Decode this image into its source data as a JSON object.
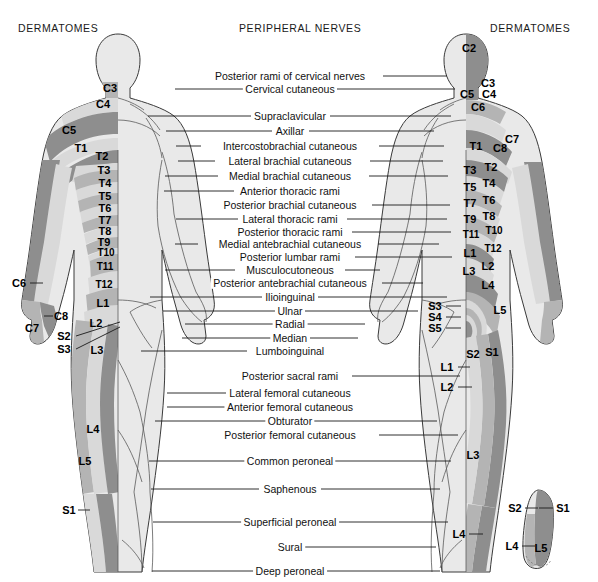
{
  "headers": {
    "left": "DERMATOMES",
    "middle": "PERIPHERAL NERVES",
    "right": "DERMATOMES"
  },
  "colors": {
    "background": "#ffffff",
    "body_fill": "#e9e9e9",
    "outline": "#3a3a3a",
    "band_light": "#d9d9d9",
    "band_mid": "#b4b4b4",
    "band_dark": "#8e8e8e",
    "band_darker": "#6f6f6f",
    "text": "#111111",
    "leader_line": "#1a1a1a"
  },
  "peripheral_nerves": [
    {
      "label": "Posterior rami of cervical nerves",
      "cx": 290,
      "cy": 76,
      "left_line": null,
      "right_line": [
        383,
        76,
        447,
        76
      ]
    },
    {
      "label": "Cervical cutaneous",
      "cx": 290,
      "cy": 89,
      "left_line": [
        175,
        89,
        244,
        89
      ],
      "right_line": [
        337,
        89,
        455,
        89
      ]
    },
    {
      "label": "Supraclavicular",
      "cx": 290,
      "cy": 116,
      "left_line": [
        148,
        116,
        251,
        116
      ],
      "right_line": [
        330,
        116,
        451,
        116
      ]
    },
    {
      "label": "Axillar",
      "cx": 290,
      "cy": 131,
      "left_line": [
        166,
        131,
        272,
        131
      ],
      "right_line": [
        309,
        131,
        434,
        131
      ]
    },
    {
      "label": "Intercostobrachial cutaneous",
      "cx": 290,
      "cy": 146,
      "left_line": [
        176,
        146,
        201,
        146
      ],
      "right_line": [
        379,
        146,
        444,
        146
      ]
    },
    {
      "label": "Lateral brachial cutaneous",
      "cx": 290,
      "cy": 161,
      "left_line": [
        178,
        161,
        215,
        161
      ],
      "right_line": [
        370,
        161,
        443,
        161
      ]
    },
    {
      "label": "Medial brachial cutaneous",
      "cx": 290,
      "cy": 176,
      "left_line": [
        165,
        176,
        218,
        176
      ],
      "right_line": [
        369,
        176,
        448,
        176
      ]
    },
    {
      "label": "Anterior thoracic rami",
      "cx": 290,
      "cy": 191,
      "left_line": [
        164,
        191,
        234,
        191
      ],
      "right_line": null
    },
    {
      "label": "Posterior brachial cutaneous",
      "cx": 290,
      "cy": 205,
      "left_line": null,
      "right_line": [
        372,
        205,
        450,
        205
      ]
    },
    {
      "label": "Lateral thoracic rami",
      "cx": 290,
      "cy": 219,
      "left_line": [
        176,
        219,
        238,
        219
      ],
      "right_line": [
        347,
        219,
        447,
        219
      ]
    },
    {
      "label": "Posterior thoracic rami",
      "cx": 290,
      "cy": 232,
      "left_line": null,
      "right_line": [
        352,
        232,
        451,
        232
      ]
    },
    {
      "label": "Medial antebrachial cutaneous",
      "cx": 290,
      "cy": 244,
      "left_line": [
        175,
        244,
        198,
        244
      ],
      "right_line": [
        378,
        244,
        439,
        244
      ]
    },
    {
      "label": "Posterior lumbar rami",
      "cx": 290,
      "cy": 257,
      "left_line": null,
      "right_line": [
        355,
        257,
        452,
        257
      ]
    },
    {
      "label": "Musculocutoneous",
      "cx": 290,
      "cy": 270,
      "left_line": [
        165,
        270,
        235,
        270
      ],
      "right_line": [
        345,
        270,
        380,
        270
      ]
    },
    {
      "label": "Posterior antebrachial cutaneous",
      "cx": 290,
      "cy": 283,
      "left_line": null,
      "right_line": [
        382,
        283,
        423,
        283
      ]
    },
    {
      "label": "Ilioinguinal",
      "cx": 290,
      "cy": 297,
      "left_line": [
        150,
        297,
        262,
        297
      ],
      "right_line": [
        318,
        297,
        447,
        297
      ]
    },
    {
      "label": "Ulnar",
      "cx": 290,
      "cy": 311,
      "left_line": [
        163,
        311,
        276,
        311
      ],
      "right_line": [
        305,
        311,
        418,
        311
      ]
    },
    {
      "label": "Radial",
      "cx": 290,
      "cy": 324,
      "left_line": [
        185,
        324,
        273,
        324
      ],
      "right_line": [
        307,
        324,
        365,
        324
      ]
    },
    {
      "label": "Median",
      "cx": 290,
      "cy": 338,
      "left_line": [
        182,
        338,
        271,
        338
      ],
      "right_line": [
        310,
        338,
        358,
        338
      ]
    },
    {
      "label": "Lumboinguinal",
      "cx": 290,
      "cy": 351,
      "left_line": [
        141,
        351,
        247,
        351
      ],
      "right_line": null
    },
    {
      "label": "Posterior sacral rami",
      "cx": 290,
      "cy": 376,
      "left_line": null,
      "right_line": [
        352,
        376,
        460,
        376
      ]
    },
    {
      "label": "Lateral femoral cutaneous",
      "cx": 290,
      "cy": 393,
      "left_line": [
        167,
        393,
        226,
        393
      ],
      "right_line": null
    },
    {
      "label": "Anterior femoral cutaneous",
      "cx": 290,
      "cy": 407,
      "left_line": [
        167,
        407,
        225,
        407
      ],
      "right_line": null
    },
    {
      "label": "Obturator",
      "cx": 290,
      "cy": 421,
      "left_line": [
        155,
        421,
        266,
        421
      ],
      "right_line": [
        314,
        421,
        437,
        421
      ]
    },
    {
      "label": "Posterior femoral cutaneous",
      "cx": 290,
      "cy": 435,
      "left_line": null,
      "right_line": [
        379,
        435,
        458,
        435
      ]
    },
    {
      "label": "Common peroneal",
      "cx": 290,
      "cy": 461,
      "left_line": [
        149,
        461,
        250,
        461
      ],
      "right_line": [
        331,
        461,
        451,
        461
      ]
    },
    {
      "label": "Saphenous",
      "cx": 290,
      "cy": 489,
      "left_line": [
        151,
        489,
        259,
        489
      ],
      "right_line": [
        321,
        489,
        440,
        489
      ]
    },
    {
      "label": "Superficial peroneal",
      "cx": 290,
      "cy": 522,
      "left_line": [
        153,
        522,
        244,
        522
      ],
      "right_line": [
        336,
        522,
        448,
        522
      ]
    },
    {
      "label": "Sural",
      "cx": 290,
      "cy": 547,
      "left_line": null,
      "right_line": [
        303,
        547,
        436,
        547
      ]
    },
    {
      "label": "Deep peroneal",
      "cx": 290,
      "cy": 571,
      "left_line": [
        152,
        571,
        256,
        571
      ],
      "right_line": [
        325,
        571,
        440,
        571
      ]
    }
  ],
  "dermatomes_left": [
    {
      "label": "C3",
      "cx": 110,
      "cy": 88,
      "leader": null
    },
    {
      "label": "C4",
      "cx": 103,
      "cy": 104,
      "leader": null
    },
    {
      "label": "C5",
      "cx": 69,
      "cy": 130,
      "leader": null
    },
    {
      "label": "T1",
      "cx": 81,
      "cy": 148,
      "leader": null
    },
    {
      "label": "T2",
      "cx": 102,
      "cy": 156,
      "leader": null
    },
    {
      "label": "T3",
      "cx": 104,
      "cy": 170,
      "leader": null
    },
    {
      "label": "T4",
      "cx": 105,
      "cy": 183,
      "leader": null
    },
    {
      "label": "T5",
      "cx": 105,
      "cy": 196,
      "leader": null
    },
    {
      "label": "T6",
      "cx": 105,
      "cy": 208,
      "leader": null
    },
    {
      "label": "T7",
      "cx": 105,
      "cy": 220,
      "leader": null
    },
    {
      "label": "T8",
      "cx": 105,
      "cy": 231,
      "leader": null
    },
    {
      "label": "T9",
      "cx": 104,
      "cy": 242,
      "leader": null
    },
    {
      "label": "T10",
      "cx": 106,
      "cy": 253,
      "leader": null
    },
    {
      "label": "T11",
      "cx": 105,
      "cy": 267,
      "leader": null
    },
    {
      "label": "T12",
      "cx": 104,
      "cy": 285,
      "leader": null
    },
    {
      "label": "C6",
      "cx": 19,
      "cy": 283,
      "leader": [
        30,
        283,
        43,
        283
      ]
    },
    {
      "label": "C8",
      "cx": 61,
      "cy": 316,
      "leader": [
        44,
        316,
        53,
        316
      ]
    },
    {
      "label": "C7",
      "cx": 32,
      "cy": 328,
      "leader": null
    },
    {
      "label": "L1",
      "cx": 103,
      "cy": 303,
      "leader": null
    },
    {
      "label": "L2",
      "cx": 96,
      "cy": 323,
      "leader": null
    },
    {
      "label": "S2",
      "cx": 64,
      "cy": 336,
      "leader": [
        76,
        336,
        120,
        322
      ]
    },
    {
      "label": "S3",
      "cx": 64,
      "cy": 349,
      "leader": [
        76,
        349,
        120,
        327
      ]
    },
    {
      "label": "L3",
      "cx": 97,
      "cy": 350,
      "leader": null
    },
    {
      "label": "L4",
      "cx": 93,
      "cy": 429,
      "leader": null
    },
    {
      "label": "L5",
      "cx": 85,
      "cy": 461,
      "leader": null
    },
    {
      "label": "S1",
      "cx": 69,
      "cy": 510,
      "leader": [
        78,
        510,
        90,
        510
      ]
    }
  ],
  "dermatomes_right": [
    {
      "label": "C2",
      "cx": 469,
      "cy": 48,
      "leader": null
    },
    {
      "label": "C3",
      "cx": 488,
      "cy": 83,
      "leader": null
    },
    {
      "label": "C4",
      "cx": 489,
      "cy": 94,
      "leader": null
    },
    {
      "label": "C5",
      "cx": 467,
      "cy": 94,
      "leader": null
    },
    {
      "label": "C6",
      "cx": 478,
      "cy": 107,
      "leader": null
    },
    {
      "label": "C7",
      "cx": 512,
      "cy": 139,
      "leader": null
    },
    {
      "label": "T1",
      "cx": 476,
      "cy": 146,
      "leader": null
    },
    {
      "label": "C8",
      "cx": 500,
      "cy": 148,
      "leader": null
    },
    {
      "label": "T3",
      "cx": 470,
      "cy": 170,
      "leader": null
    },
    {
      "label": "T2",
      "cx": 491,
      "cy": 167,
      "leader": null
    },
    {
      "label": "T5",
      "cx": 470,
      "cy": 187,
      "leader": null
    },
    {
      "label": "T4",
      "cx": 489,
      "cy": 183,
      "leader": null
    },
    {
      "label": "T7",
      "cx": 470,
      "cy": 203,
      "leader": null
    },
    {
      "label": "T6",
      "cx": 489,
      "cy": 200,
      "leader": null
    },
    {
      "label": "T9",
      "cx": 470,
      "cy": 219,
      "leader": null
    },
    {
      "label": "T8",
      "cx": 489,
      "cy": 216,
      "leader": null
    },
    {
      "label": "T11",
      "cx": 471,
      "cy": 235,
      "leader": null
    },
    {
      "label": "T10",
      "cx": 494,
      "cy": 231,
      "leader": null
    },
    {
      "label": "L1",
      "cx": 470,
      "cy": 253,
      "leader": null
    },
    {
      "label": "T12",
      "cx": 493,
      "cy": 249,
      "leader": null
    },
    {
      "label": "L3",
      "cx": 469,
      "cy": 271,
      "leader": null
    },
    {
      "label": "L2",
      "cx": 488,
      "cy": 266,
      "leader": null
    },
    {
      "label": "L4",
      "cx": 488,
      "cy": 285,
      "leader": null
    },
    {
      "label": "L5",
      "cx": 500,
      "cy": 310,
      "leader": null
    },
    {
      "label": "S3",
      "cx": 435,
      "cy": 306,
      "leader": [
        446,
        306,
        461,
        306
      ]
    },
    {
      "label": "S4",
      "cx": 435,
      "cy": 317,
      "leader": [
        446,
        317,
        461,
        317
      ]
    },
    {
      "label": "S5",
      "cx": 435,
      "cy": 328,
      "leader": [
        446,
        328,
        461,
        328
      ]
    },
    {
      "label": "S2",
      "cx": 473,
      "cy": 354,
      "leader": null
    },
    {
      "label": "S1",
      "cx": 492,
      "cy": 352,
      "leader": null
    },
    {
      "label": "L1",
      "cx": 447,
      "cy": 367,
      "leader": [
        458,
        367,
        470,
        367
      ]
    },
    {
      "label": "L2",
      "cx": 447,
      "cy": 387,
      "leader": [
        458,
        387,
        472,
        387
      ]
    },
    {
      "label": "L3",
      "cx": 473,
      "cy": 455,
      "leader": null
    },
    {
      "label": "L4",
      "cx": 459,
      "cy": 534,
      "leader": [
        469,
        534,
        483,
        534
      ]
    }
  ],
  "foot_inset": [
    {
      "label": "S2",
      "cx": 515,
      "cy": 508,
      "leader": [
        525,
        508,
        538,
        508
      ]
    },
    {
      "label": "S1",
      "cx": 563,
      "cy": 508,
      "leader": [
        539,
        508,
        553,
        508
      ]
    },
    {
      "label": "L4",
      "cx": 512,
      "cy": 546,
      "leader": [
        522,
        546,
        535,
        546
      ]
    },
    {
      "label": "L5",
      "cx": 541,
      "cy": 548,
      "leader": null
    }
  ]
}
